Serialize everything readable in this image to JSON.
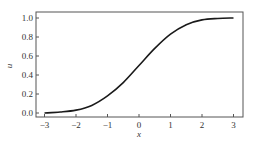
{
  "chart_data": {
    "type": "line",
    "title": "",
    "xlabel": "x",
    "ylabel": "u",
    "xlim": [
      -3.3,
      3.3
    ],
    "ylim": [
      -0.03,
      1.03
    ],
    "xticks": [
      -3,
      -2,
      -1,
      0,
      1,
      2,
      3
    ],
    "xtick_labels": [
      "−3",
      "−2",
      "−1",
      "0",
      "1",
      "2",
      "3"
    ],
    "yticks": [
      0.0,
      0.2,
      0.4,
      0.6,
      0.8,
      1.0
    ],
    "ytick_labels": [
      "0.0",
      "0.2",
      "0.4",
      "0.6",
      "0.8",
      "1.0"
    ],
    "grid": false,
    "legend": null,
    "series": [
      {
        "name": "u(x)",
        "color": "#1a1a1a",
        "x": [
          -3.0,
          -2.5,
          -2.0,
          -1.5,
          -1.0,
          -0.5,
          0.0,
          0.5,
          1.0,
          1.5,
          2.0,
          2.5,
          3.0
        ],
        "values": [
          0.0,
          0.01,
          0.03,
          0.08,
          0.18,
          0.32,
          0.5,
          0.68,
          0.83,
          0.93,
          0.98,
          0.995,
          1.0
        ]
      }
    ]
  }
}
